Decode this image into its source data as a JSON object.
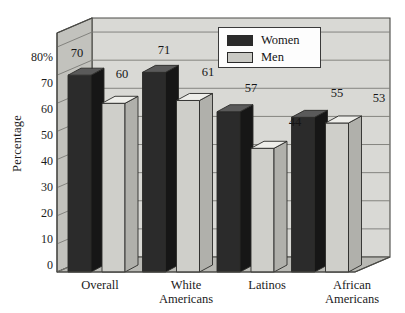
{
  "chart_data": {
    "type": "bar",
    "title": "",
    "subtitle": "",
    "xlabel": "",
    "ylabel": "Percentage",
    "categories": [
      "Overall",
      "White Americans",
      "Latinos",
      "African Americans"
    ],
    "series": [
      {
        "name": "Women",
        "values": [
          70,
          71,
          57,
          55
        ],
        "color": "#2b2b2b"
      },
      {
        "name": "Men",
        "values": [
          60,
          61,
          44,
          53
        ],
        "color": "#c9c9c4"
      }
    ],
    "ylim": [
      0,
      85
    ],
    "yticks": [
      0,
      10,
      20,
      30,
      40,
      50,
      60,
      70,
      80
    ],
    "ytick_labels": [
      "0",
      "10",
      "20",
      "30",
      "40",
      "50",
      "60",
      "70",
      "80%"
    ],
    "grid": true,
    "legend_position": "top-center",
    "style": "3d-bar"
  },
  "legend": {
    "items": [
      {
        "label": "Women",
        "color": "#2b2b2b"
      },
      {
        "label": "Men",
        "color": "#c9c9c4"
      }
    ]
  },
  "axis": {
    "y_title": "Percentage",
    "ticks": [
      "80%",
      "70",
      "60",
      "50",
      "40",
      "30",
      "20",
      "10",
      "0"
    ]
  },
  "categories": [
    {
      "line1": "Overall",
      "line2": ""
    },
    {
      "line1": "White",
      "line2": "Americans"
    },
    {
      "line1": "Latinos",
      "line2": ""
    },
    {
      "line1": "African",
      "line2": "Americans"
    }
  ],
  "value_labels": [
    "70",
    "60",
    "71",
    "61",
    "57",
    "44",
    "55",
    "53"
  ],
  "colors": {
    "wall": "#d9d9d5",
    "wall_left": "#c2c2bd",
    "floor": "#b9b9b4",
    "women_front": "#2b2b2b",
    "women_side": "#161616",
    "women_top": "#5a5a5a",
    "men_front": "#cfcfca",
    "men_side": "#b0b0ab",
    "men_top": "#eeeeea",
    "gridline": "#7a7a76",
    "frame": "#4a4a46",
    "text": "#151515"
  }
}
